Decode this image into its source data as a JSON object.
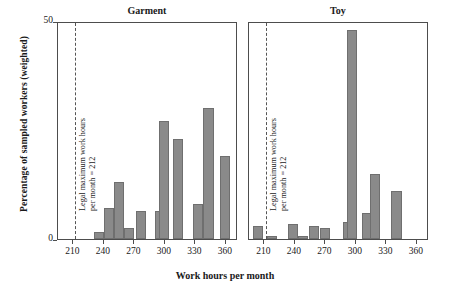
{
  "figure": {
    "xlabel": "Work hours per month",
    "ylabel": "Percentage of sampled workers (weighted)",
    "annotation_line1": "Legal maximum work hours",
    "annotation_line2": "per month = 212"
  },
  "axis": {
    "y_ticklabels": [
      "50",
      "0"
    ],
    "x_ticklabels": [
      "210",
      "240",
      "270",
      "300",
      "330",
      "360"
    ]
  },
  "panels": [
    {
      "title": "Garment"
    },
    {
      "title": "Toy"
    }
  ],
  "colors": {
    "bar_fill": "#8a8a8a",
    "bar_edge": "#6f6f6f",
    "axis": "#4d4d4d",
    "vline": "#555555"
  },
  "chart_data": {
    "type": "bar",
    "title": "",
    "xlabel": "Work hours per month",
    "ylabel": "Percentage of sampled workers (weighted)",
    "ylim": [
      0,
      50
    ],
    "xlim": [
      195,
      372
    ],
    "xticks": [
      210,
      240,
      270,
      300,
      330,
      360
    ],
    "yticks": [
      0,
      50
    ],
    "grid": false,
    "legend": null,
    "annotations": [
      {
        "type": "vline",
        "x": 212,
        "style": "dashed",
        "text": "Legal maximum work hours per month = 212"
      }
    ],
    "panels": [
      {
        "name": "Garment",
        "bin_width": 10,
        "bars": [
          {
            "x": 235,
            "value": 1.5
          },
          {
            "x": 245,
            "value": 7.0
          },
          {
            "x": 255,
            "value": 13.0
          },
          {
            "x": 265,
            "value": 2.5
          },
          {
            "x": 277,
            "value": 6.5
          },
          {
            "x": 295,
            "value": 6.5
          },
          {
            "x": 299,
            "value": 27.0
          },
          {
            "x": 313,
            "value": 23.0
          },
          {
            "x": 333,
            "value": 8.0
          },
          {
            "x": 343,
            "value": 30.0
          },
          {
            "x": 359,
            "value": 19.0
          }
        ]
      },
      {
        "name": "Toy",
        "bin_width": 10,
        "bars": [
          {
            "x": 204,
            "value": 3.0
          },
          {
            "x": 218,
            "value": 0.6
          },
          {
            "x": 238,
            "value": 3.5
          },
          {
            "x": 248,
            "value": 0.6
          },
          {
            "x": 259,
            "value": 3.0
          },
          {
            "x": 270,
            "value": 2.5
          },
          {
            "x": 292,
            "value": 4.0
          },
          {
            "x": 296,
            "value": 48.0
          },
          {
            "x": 311,
            "value": 6.0
          },
          {
            "x": 319,
            "value": 15.0
          },
          {
            "x": 340,
            "value": 11.0
          }
        ]
      }
    ]
  }
}
